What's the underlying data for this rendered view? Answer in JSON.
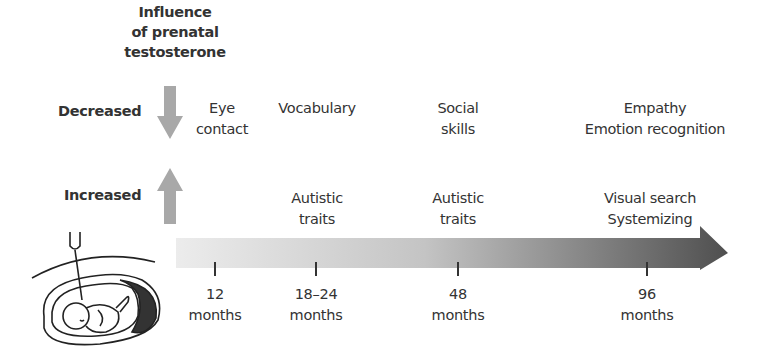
{
  "header": {
    "title_lines": [
      "Influence",
      "of prenatal",
      "testosterone"
    ]
  },
  "effects": {
    "decreased_label": "Decreased",
    "increased_label": "Increased",
    "decreased_icon": "down-arrow-icon",
    "increased_icon": "up-arrow-icon"
  },
  "decreased_items": [
    {
      "lines": [
        "Eye",
        "contact"
      ]
    },
    {
      "lines": [
        "Vocabulary"
      ]
    },
    {
      "lines": [
        "Social",
        "skills"
      ]
    },
    {
      "lines": [
        "Empathy",
        "Emotion recognition"
      ]
    }
  ],
  "increased_items": [
    {
      "lines": [
        "Autistic",
        "traits"
      ]
    },
    {
      "lines": [
        "Autistic",
        "traits"
      ]
    },
    {
      "lines": [
        "Visual search",
        "Systemizing"
      ]
    }
  ],
  "timeline": {
    "arrow_icon": "timeline-arrow-icon",
    "ticks": [
      {
        "value": "12",
        "unit": "months"
      },
      {
        "value": "18–24",
        "unit": "months"
      },
      {
        "value": "48",
        "unit": "months"
      },
      {
        "value": "96",
        "unit": "months"
      }
    ]
  },
  "illustration": {
    "icon": "fetus-amniocentesis-icon"
  },
  "colors": {
    "arrow_light": "#e2e2e2",
    "arrow_dark": "#555555",
    "indicator_arrow": "#a8a8a8",
    "text": "#333333"
  }
}
